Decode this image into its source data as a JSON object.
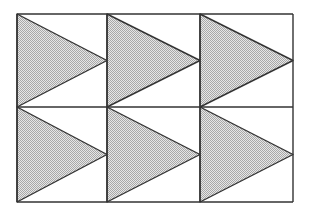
{
  "figure": {
    "rows": 2,
    "columns": 3,
    "grid": {
      "x_lines": [
        17,
        107,
        200,
        293
      ],
      "y_lines": [
        14,
        107,
        202
      ]
    },
    "colors": {
      "stroke": "#333333",
      "fill_light": "#e6e6e6",
      "fill_dark": "#a8a8a8",
      "background": "#ffffff"
    },
    "shape": "triangle-right",
    "cells": [
      {
        "row": 0,
        "col": 0
      },
      {
        "row": 0,
        "col": 1
      },
      {
        "row": 0,
        "col": 2
      },
      {
        "row": 1,
        "col": 0
      },
      {
        "row": 1,
        "col": 1
      },
      {
        "row": 1,
        "col": 2
      }
    ]
  }
}
